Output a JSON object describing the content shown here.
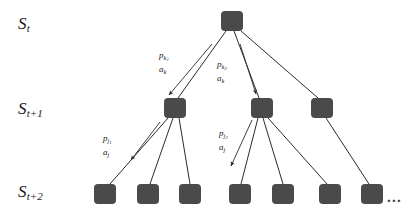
{
  "figure": {
    "background_color": "#ffffff",
    "node_color": "#4a4a4a",
    "edge_color": "#2b2b2b",
    "text_color": "#1a1a1a"
  },
  "state_labels": [
    {
      "id": "s-t",
      "base": "S",
      "sub": "t",
      "x": 18,
      "y": 14
    },
    {
      "id": "s-t1",
      "base": "S",
      "sub": "t+1",
      "x": 18,
      "y": 99
    },
    {
      "id": "s-t2",
      "base": "S",
      "sub": "t+2",
      "x": 18,
      "y": 182
    }
  ],
  "edge_labels": [
    {
      "id": "branch-k1",
      "prob": "p",
      "prob_sub": "k",
      "prob_subsub": "1",
      "action": "a",
      "action_sub": "k",
      "x": 159,
      "y": 50
    },
    {
      "id": "branch-k2",
      "prob": "p",
      "prob_sub": "k",
      "prob_subsub": "2",
      "action": "a",
      "action_sub": "k",
      "x": 217,
      "y": 59
    },
    {
      "id": "branch-j1",
      "prob": "p",
      "prob_sub": "j",
      "prob_subsub": "1",
      "action": "a",
      "action_sub": "j",
      "x": 103,
      "y": 133
    },
    {
      "id": "branch-j2",
      "prob": "p",
      "prob_sub": "j",
      "prob_subsub": "2",
      "action": "a",
      "action_sub": "j",
      "x": 219,
      "y": 128
    }
  ],
  "nodes": {
    "root": [
      {
        "id": "n0",
        "cx": 232,
        "cy": 21
      }
    ],
    "level1": [
      {
        "id": "n1",
        "cx": 175,
        "cy": 108
      },
      {
        "id": "n2",
        "cx": 262,
        "cy": 108
      },
      {
        "id": "n3",
        "cx": 322,
        "cy": 108
      }
    ],
    "level2": [
      {
        "id": "m1",
        "cx": 105,
        "cy": 194
      },
      {
        "id": "m2",
        "cx": 148,
        "cy": 194
      },
      {
        "id": "m3",
        "cx": 190,
        "cy": 194
      },
      {
        "id": "m4",
        "cx": 240,
        "cy": 194
      },
      {
        "id": "m5",
        "cx": 283,
        "cy": 194
      },
      {
        "id": "m6",
        "cx": 330,
        "cy": 194
      },
      {
        "id": "m7",
        "cx": 372,
        "cy": 194
      }
    ]
  },
  "node_size": {
    "width": 22,
    "height": 20,
    "radius": 4
  },
  "edges": [
    {
      "id": "e-root-n1",
      "from": "root",
      "to": "n1",
      "x1": 226,
      "y1": 31,
      "x2": 178,
      "y2": 98,
      "arrow": false
    },
    {
      "id": "e-root-n2",
      "from": "root",
      "to": "n2",
      "x1": 234,
      "y1": 31,
      "x2": 259,
      "y2": 98,
      "arrow": false
    },
    {
      "id": "e-root-n3",
      "from": "root",
      "to": "n3",
      "x1": 241,
      "y1": 31,
      "x2": 318,
      "y2": 98,
      "arrow": false
    },
    {
      "id": "e-root-n1-arrow",
      "from": "root",
      "to": "n1",
      "x1": 212,
      "y1": 44,
      "x2": 169,
      "y2": 95,
      "arrow": true
    },
    {
      "id": "e-root-n2-arrow",
      "from": "root",
      "to": "n2",
      "x1": 240,
      "y1": 44,
      "x2": 256,
      "y2": 94,
      "arrow": true
    },
    {
      "id": "e-n1-m1",
      "from": "n1",
      "to": "m1",
      "x1": 168,
      "y1": 118,
      "x2": 110,
      "y2": 184,
      "arrow": false
    },
    {
      "id": "e-n1-m2",
      "from": "n1",
      "to": "m2",
      "x1": 173,
      "y1": 118,
      "x2": 150,
      "y2": 184,
      "arrow": false
    },
    {
      "id": "e-n1-m3",
      "from": "n1",
      "to": "m3",
      "x1": 179,
      "y1": 118,
      "x2": 190,
      "y2": 184,
      "arrow": false
    },
    {
      "id": "e-n1-m1-arrow",
      "from": "n1",
      "to": "m1",
      "x1": 160,
      "y1": 122,
      "x2": 131,
      "y2": 160,
      "arrow": true
    },
    {
      "id": "e-n2-m4",
      "from": "n2",
      "to": "m4",
      "x1": 258,
      "y1": 118,
      "x2": 241,
      "y2": 184,
      "arrow": false
    },
    {
      "id": "e-n2-m5",
      "from": "n2",
      "to": "m5",
      "x1": 263,
      "y1": 118,
      "x2": 283,
      "y2": 184,
      "arrow": false
    },
    {
      "id": "e-n2-m6",
      "from": "n2",
      "to": "m6",
      "x1": 268,
      "y1": 118,
      "x2": 327,
      "y2": 184,
      "arrow": false
    },
    {
      "id": "e-n2-m4-arrow",
      "from": "n2",
      "to": "m4",
      "x1": 252,
      "y1": 120,
      "x2": 231,
      "y2": 166,
      "arrow": true
    },
    {
      "id": "e-n3-m7",
      "from": "n3",
      "to": "m7",
      "x1": 326,
      "y1": 118,
      "x2": 369,
      "y2": 184,
      "arrow": false
    }
  ],
  "ellipsis": {
    "id": "tail-ellipsis",
    "text": "...",
    "x": 387,
    "y": 190
  }
}
